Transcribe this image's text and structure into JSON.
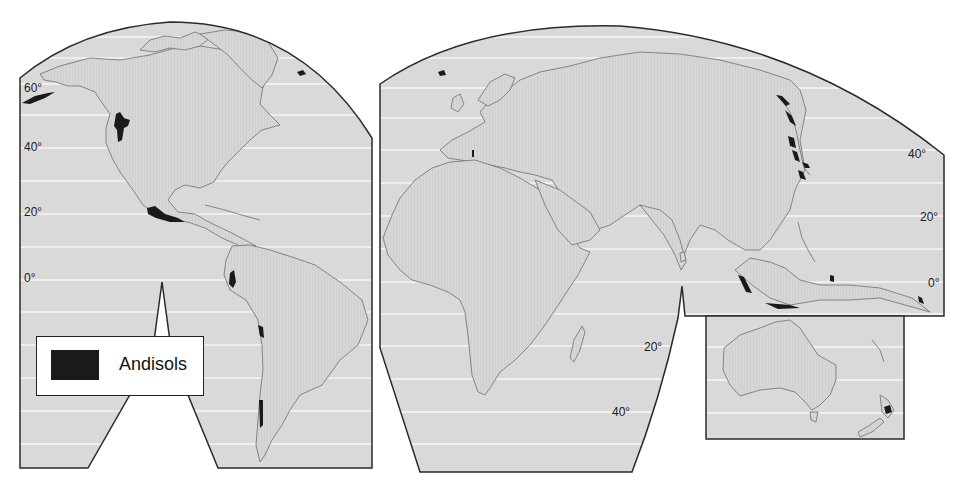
{
  "map": {
    "subject": "Global distribution of Andisols",
    "projection": "interrupted",
    "colors": {
      "background": "#ffffff",
      "ocean_fill": "#d9d9d9",
      "land_fill": "#d4d4d4",
      "graticule": "#f4f4f4",
      "coastline": "#6e6e6e",
      "border": "#2a2a2a",
      "andisols": "#1a1a1a"
    },
    "legend": {
      "items": [
        {
          "label": "Andisols",
          "color": "#1a1a1a"
        }
      ]
    },
    "latitude_labels": {
      "americas_panel": [
        "60°",
        "40°",
        "20°",
        "0°"
      ],
      "eurasia_panel_east": [
        "40°",
        "20°",
        "0°"
      ],
      "indian_ocean": [
        "20°",
        "40°"
      ]
    },
    "panels": [
      "Americas",
      "Europe-Africa-Asia",
      "Australia-New Zealand"
    ]
  }
}
